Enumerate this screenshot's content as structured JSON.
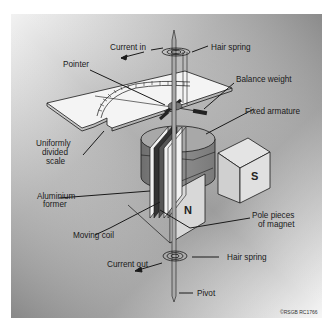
{
  "diagram": {
    "labels": {
      "current_in": "Current in",
      "hair_spring_top": "Hair spring",
      "pointer": "Pointer",
      "balance_weight": "Balance weight",
      "fixed_armature": "Fixed armature",
      "scale_line1": "Uniformly",
      "scale_line2": "divided",
      "scale_line3": "scale",
      "aluminium_line1": "Aluminium",
      "aluminium_line2": "former",
      "moving_coil": "Moving coil",
      "pole_pieces_line1": "Pole pieces",
      "pole_pieces_line2": "of magnet",
      "current_out": "Current out",
      "hair_spring_bottom": "Hair spring",
      "pivot": "Pivot"
    },
    "poles": {
      "north": "N",
      "south": "S"
    },
    "copyright": "©RSGB RC1766",
    "colors": {
      "background": "#ffffff",
      "panel_light": "#f4f4f4",
      "panel_dark": "#8a8a8a",
      "cylinder": "#8c8c8c",
      "cylinder_top": "#a8a8a8",
      "magnet": "#d6d6d6",
      "line": "#1a1a1a"
    }
  }
}
